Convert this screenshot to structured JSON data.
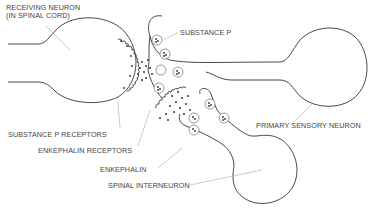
{
  "diagram": {
    "type": "neuron synapse illustration",
    "labels": {
      "receiving_neuron_line1": "RECEIVING NEURON",
      "receiving_neuron_line2": "(IN SPINAL CORD)",
      "substance_p": "SUBSTANCE P",
      "substance_p_receptors": "SUBSTANCE P RECEPTORS",
      "enkephalin_receptors": "ENKEPHALIN RECEPTORS",
      "enkephalin": "ENKEPHALIN",
      "spinal_interneuron": "SPINAL INTERNEURON",
      "primary_sensory_neuron": "PRIMARY SENSORY NEURON"
    },
    "nodes": [
      {
        "id": "receiving-neuron",
        "label": "RECEIVING NEURON (IN SPINAL CORD)"
      },
      {
        "id": "primary-sensory-neuron",
        "label": "PRIMARY SENSORY NEURON"
      },
      {
        "id": "spinal-interneuron",
        "label": "SPINAL INTERNEURON"
      },
      {
        "id": "substance-p",
        "label": "SUBSTANCE P"
      },
      {
        "id": "enkephalin",
        "label": "ENKEPHALIN"
      }
    ],
    "colors": {
      "stroke": "#333333",
      "background": "#ffffff",
      "leader": "#999999"
    }
  }
}
